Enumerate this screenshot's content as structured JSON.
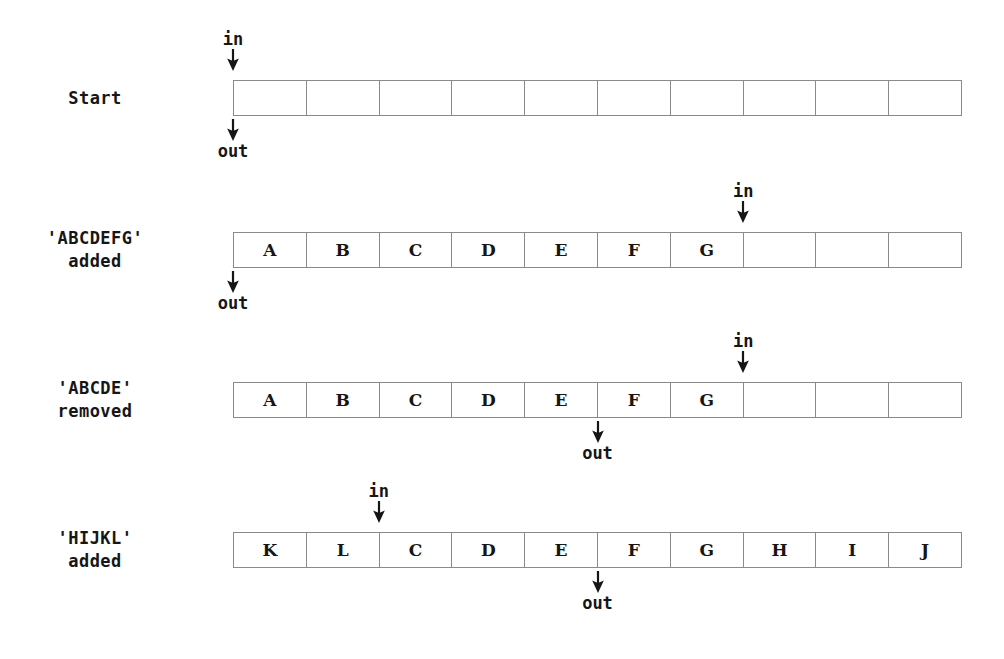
{
  "figure": {
    "capacity": 10,
    "labels": {
      "in": "in",
      "out": "out"
    },
    "colors": {
      "cell_border": "#8a8a8a",
      "text": "#161616",
      "background": "#ffffff"
    },
    "geometry": {
      "strip_left": 233,
      "strip_width": 729,
      "strip_height": 36,
      "cells": 10
    }
  },
  "rows": [
    {
      "label_line1": "Start",
      "label_line2": "",
      "cells": [
        "",
        "",
        "",
        "",
        "",
        "",
        "",
        "",
        "",
        ""
      ],
      "in_label": "in",
      "out_label": "out",
      "in_index": 0,
      "out_index": 0,
      "in_above": true,
      "out_above": false,
      "strip_top": 80,
      "in_text_top": 30,
      "in_arrow_top": 49,
      "out_arrow_top": 119,
      "out_text_top": 144
    },
    {
      "label_line1": "'ABCDEFG'",
      "label_line2": "added",
      "cells": [
        "A",
        "B",
        "C",
        "D",
        "E",
        "F",
        "G",
        "",
        "",
        ""
      ],
      "in_label": "in",
      "out_label": "out",
      "in_index": 7,
      "out_index": 0,
      "in_above": true,
      "out_above": false,
      "strip_top": 232,
      "in_text_top": 182,
      "in_arrow_top": 201,
      "out_arrow_top": 271,
      "out_text_top": 296
    },
    {
      "label_line1": "'ABCDE'",
      "label_line2": "removed",
      "cells": [
        "A",
        "B",
        "C",
        "D",
        "E",
        "F",
        "G",
        "",
        "",
        ""
      ],
      "in_label": "in",
      "out_label": "out",
      "in_index": 7,
      "out_index": 5,
      "in_above": true,
      "out_above": false,
      "strip_top": 382,
      "in_text_top": 332,
      "in_arrow_top": 351,
      "out_arrow_top": 421,
      "out_text_top": 446
    },
    {
      "label_line1": "'HIJKL'",
      "label_line2": "added",
      "cells": [
        "K",
        "L",
        "C",
        "D",
        "E",
        "F",
        "G",
        "H",
        "I",
        "J"
      ],
      "in_label": "in",
      "out_label": "out",
      "in_index": 2,
      "out_index": 5,
      "in_above": true,
      "out_above": false,
      "strip_top": 532,
      "in_text_top": 482,
      "in_arrow_top": 501,
      "out_arrow_top": 571,
      "out_text_top": 596
    }
  ]
}
